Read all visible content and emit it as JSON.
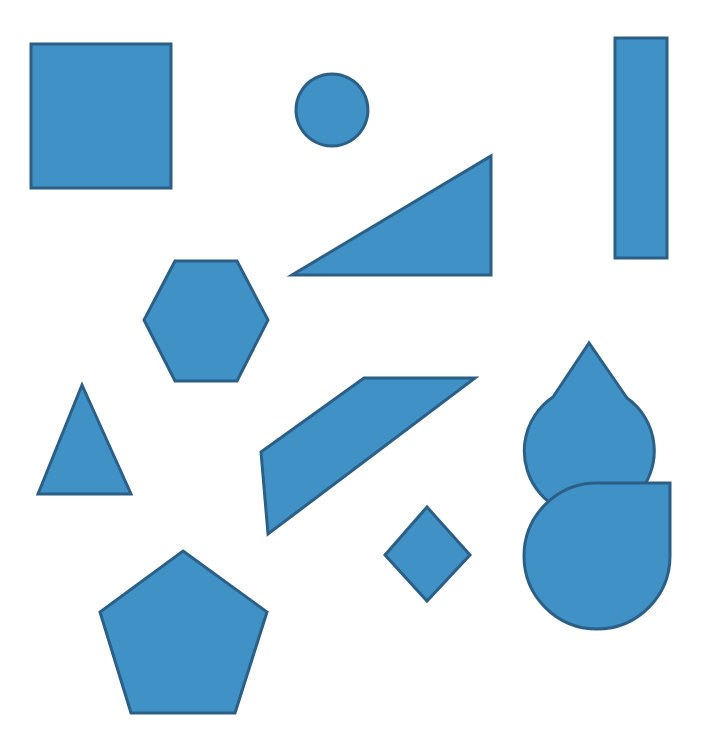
{
  "canvas": {
    "title": "Geometric Shapes Canvas",
    "width": 714,
    "height": 754,
    "background_color": "#FFFFFF",
    "shape_count": 12
  },
  "style": {
    "fill_color": "#4091C6",
    "stroke_color": "#2C5F86",
    "stroke_width": 3
  },
  "shapes": [
    {
      "id": "square",
      "name": "square",
      "label": "Square",
      "kind": "rect",
      "fill": "#4091C6",
      "stroke": "#2C5F86",
      "geometry": {
        "x": 31,
        "y": 44,
        "width": 140,
        "height": 144
      },
      "svg": "M 31 44 L 171 44 L 171 188 L 31 188 Z"
    },
    {
      "id": "circle",
      "name": "circle",
      "label": "Circle",
      "kind": "circle",
      "fill": "#4091C6",
      "stroke": "#2C5F86",
      "geometry": {
        "cx": 332,
        "cy": 110,
        "r": 36
      },
      "svg": "M 332 74 A 36 36 0 1 1 331.9 74 Z"
    },
    {
      "id": "tall-rectangle",
      "name": "tall-rectangle",
      "label": "Tall Rectangle",
      "kind": "rect",
      "fill": "#4091C6",
      "stroke": "#2C5F86",
      "geometry": {
        "x": 615,
        "y": 38,
        "width": 52,
        "height": 220
      },
      "svg": "M 615 38 L 667 38 L 667 258 L 615 258 Z"
    },
    {
      "id": "right-triangle",
      "name": "right-triangle",
      "label": "Right Triangle",
      "kind": "polygon",
      "fill": "#4091C6",
      "stroke": "#2C5F86",
      "points": "292,275 491,275 491,156",
      "svg": "M 292 275 L 491 275 L 491 156 Z"
    },
    {
      "id": "hexagon",
      "name": "hexagon",
      "label": "Hexagon",
      "kind": "polygon",
      "fill": "#4091C6",
      "stroke": "#2C5F86",
      "points": "175,261 237,261 268,320 237,381 175,381 144,320",
      "svg": "M 175 261 L 237 261 L 268 320 L 237 381 L 175 381 L 144 320 Z"
    },
    {
      "id": "pacman",
      "name": "pacman-wedge",
      "label": "Circle With Wedge Cut",
      "kind": "path",
      "fill": "#4091C6",
      "stroke": "#2C5F86",
      "geometry": {
        "cx": 589,
        "cy": 343,
        "r": 65
      },
      "svg": "M 589 343 L 553 397 A 65 65 0 1 0 627 398 Z"
    },
    {
      "id": "small-triangle",
      "name": "isosceles-triangle",
      "label": "Isosceles Triangle",
      "kind": "polygon",
      "fill": "#4091C6",
      "stroke": "#2C5F86",
      "points": "82,385 131,494 38,494",
      "svg": "M 82 385 L 131 494 L 38 494 Z"
    },
    {
      "id": "quadrilateral",
      "name": "slanted-quadrilateral",
      "label": "Slanted Quadrilateral",
      "kind": "polygon",
      "fill": "#4091C6",
      "stroke": "#2C5F86",
      "points": "364,378 475,378 268,534 261,452",
      "svg": "M 364 378 L 475 378 L 268 534 L 261 452 Z"
    },
    {
      "id": "diamond",
      "name": "diamond",
      "label": "Diamond",
      "kind": "polygon",
      "fill": "#4091C6",
      "stroke": "#2C5F86",
      "points": "427,507 470,555 427,601 385,555",
      "svg": "M 427 507 L 470 555 L 427 601 L 385 555 Z"
    },
    {
      "id": "teardrop",
      "name": "teardrop",
      "label": "Teardrop",
      "kind": "path",
      "fill": "#4091C6",
      "stroke": "#2C5F86",
      "geometry": {
        "cx": 597,
        "cy": 556,
        "r": 73
      },
      "svg": "M 670 487 L 670 556 A 73 73 0 1 1 597 483 L 670 483 Z"
    },
    {
      "id": "pentagon",
      "name": "pentagon",
      "label": "Pentagon",
      "kind": "polygon",
      "fill": "#4091C6",
      "stroke": "#2C5F86",
      "points": "183,551 267,612 235,713 131,713 100,612",
      "svg": "M 183 551 L 267 612 L 235 713 L 131 713 L 100 612 Z"
    }
  ]
}
